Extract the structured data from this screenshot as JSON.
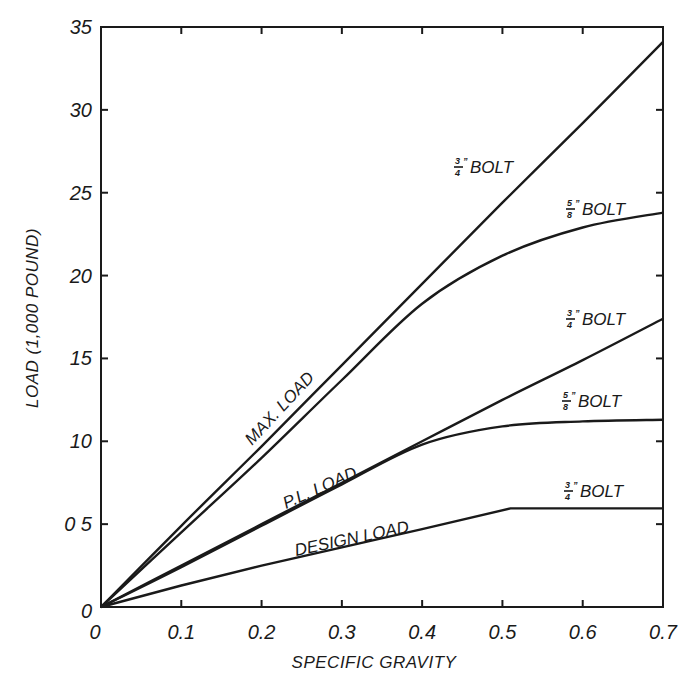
{
  "chart_data": {
    "type": "line",
    "title": "",
    "xlabel": "SPECIFIC GRAVITY",
    "ylabel": "LOAD (1,000 POUND)",
    "xlim": [
      0,
      0.7
    ],
    "ylim": [
      0,
      35
    ],
    "grid": false,
    "legend": "inline labels",
    "x_ticks": [
      0,
      0.1,
      0.2,
      0.3,
      0.4,
      0.5,
      0.6,
      0.7
    ],
    "x_tick_labels": [
      "0",
      "0.1",
      "0.2",
      "0.3",
      "0.4",
      "0.5",
      "0.6",
      "0.7"
    ],
    "y_ticks": [
      0,
      5,
      10,
      15,
      20,
      25,
      30,
      35
    ],
    "y_tick_labels": [
      "0",
      "0 5",
      "10",
      "15",
      "20",
      "25",
      "30",
      "35"
    ],
    "annotations": [
      "MAX. LOAD",
      "P.L. LOAD",
      "DESIGN LOAD"
    ],
    "series": [
      {
        "name": "Max. load, 3/4\" bolt",
        "group": "MAX. LOAD",
        "bolt": "3/4\" BOLT",
        "x": [
          0,
          0.1,
          0.2,
          0.3,
          0.4,
          0.5,
          0.6,
          0.7
        ],
        "values": [
          0,
          4.9,
          9.7,
          14.6,
          19.5,
          24.4,
          29.2,
          34.1
        ]
      },
      {
        "name": "Max. load, 5/8\" bolt",
        "group": "MAX. LOAD",
        "bolt": "5/8\" BOLT",
        "x": [
          0,
          0.1,
          0.2,
          0.3,
          0.4,
          0.5,
          0.6,
          0.7
        ],
        "values": [
          0,
          4.5,
          9.0,
          13.7,
          18.3,
          21.2,
          22.9,
          23.8
        ]
      },
      {
        "name": "P.L. load, 3/4\" bolt",
        "group": "P.L. LOAD",
        "bolt": "3/4\" BOLT",
        "x": [
          0,
          0.1,
          0.2,
          0.3,
          0.4,
          0.5,
          0.6,
          0.7
        ],
        "values": [
          0,
          2.5,
          5.0,
          7.5,
          10.0,
          12.5,
          14.9,
          17.4
        ]
      },
      {
        "name": "P.L. load, 5/8\" bolt",
        "group": "P.L. LOAD",
        "bolt": "5/8\" BOLT",
        "x": [
          0,
          0.1,
          0.2,
          0.3,
          0.4,
          0.5,
          0.6,
          0.7
        ],
        "values": [
          0,
          2.4,
          4.9,
          7.4,
          9.8,
          10.9,
          11.2,
          11.3
        ]
      },
      {
        "name": "Design load, 3/4\" bolt",
        "group": "DESIGN LOAD",
        "bolt": "3/4\" BOLT",
        "x": [
          0,
          0.1,
          0.2,
          0.3,
          0.4,
          0.51,
          0.6,
          0.7
        ],
        "values": [
          0,
          1.3,
          2.5,
          3.6,
          4.7,
          5.95,
          5.95,
          5.95
        ]
      }
    ]
  },
  "labels": {
    "max_load": "MAX. LOAD",
    "pl_load": "P.L. LOAD",
    "design_load": "DESIGN LOAD",
    "bolt": "BOLT",
    "frac_34_num": "3",
    "frac_34_den": "4",
    "frac_58_num": "5",
    "frac_58_den": "8",
    "inch_mark": "”"
  },
  "style": {
    "ink": "#1a1a1a",
    "background": "#ffffff"
  }
}
